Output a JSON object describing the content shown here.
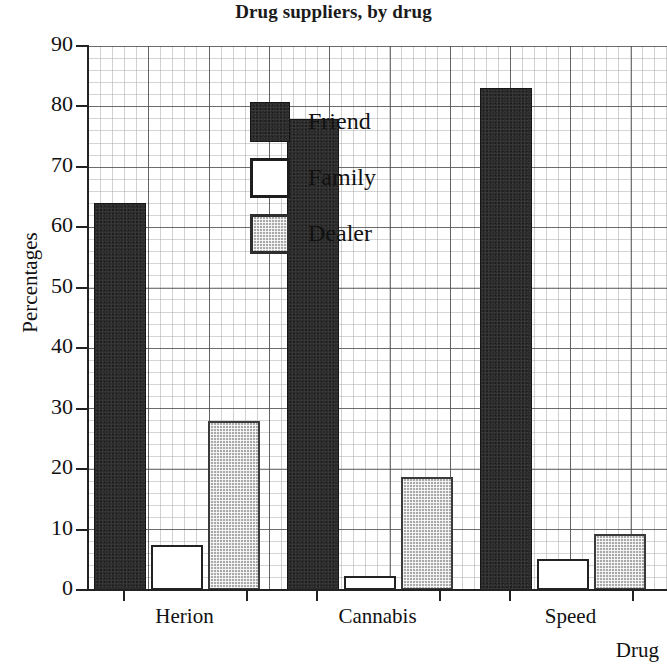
{
  "chart_data": {
    "type": "bar",
    "title": "Drug suppliers, by drug",
    "xlabel": "Drug",
    "ylabel": "Percentages",
    "categories": [
      "Herion",
      "Cannabis",
      "Speed"
    ],
    "series": [
      {
        "name": "Friend",
        "color": "#2b2b2b",
        "fill": "solid-dark",
        "values": [
          64,
          78,
          83
        ]
      },
      {
        "name": "Family",
        "color": "#ffffff",
        "fill": "white-outline",
        "values": [
          7.5,
          2.3,
          5.2
        ]
      },
      {
        "name": "Dealer",
        "color": "#a9a9a9",
        "fill": "gray-hatched",
        "values": [
          28,
          18.7,
          9.3
        ]
      }
    ],
    "ylim": [
      0,
      90
    ],
    "yticks": [
      0,
      10,
      20,
      30,
      40,
      50,
      60,
      70,
      80,
      90
    ],
    "ytick_labels": [
      "0",
      "10",
      "20",
      "30",
      "40",
      "50",
      "60",
      "70",
      "80",
      "90"
    ],
    "grid": "graph-paper minor and major gridlines",
    "legend_position": "upper-left-inside"
  }
}
